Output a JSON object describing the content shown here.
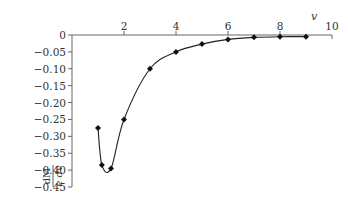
{
  "chart_data": {
    "type": "line",
    "title": "",
    "xlabel": "v",
    "ylabel": "dM / e dv",
    "ylabel_numerator": "dM",
    "ylabel_denominator": "e dv",
    "xlim": [
      0,
      10
    ],
    "ylim": [
      -0.45,
      0
    ],
    "x_ticks": [
      2,
      4,
      6,
      8,
      10
    ],
    "y_ticks": [
      0,
      -0.05,
      -0.1,
      -0.15,
      -0.2,
      -0.25,
      -0.3,
      -0.35,
      -0.4,
      -0.45
    ],
    "x_tick_labels": [
      "2",
      "4",
      "6",
      "8",
      "10"
    ],
    "y_tick_labels": [
      "0",
      "−0.05",
      "−0.10",
      "−0.15",
      "−0.20",
      "−0.25",
      "−0.30",
      "−0.35",
      "−0.40",
      "−0.45"
    ],
    "x_axis_position": "top",
    "grid": false,
    "legend": null,
    "series": [
      {
        "name": "dM/edv",
        "marker": "diamond",
        "color": "#111111",
        "x": [
          1.0,
          1.15,
          1.5,
          2.0,
          3.0,
          4.0,
          5.0,
          6.0,
          7.0,
          8.0,
          9.0
        ],
        "values": [
          -0.275,
          -0.385,
          -0.395,
          -0.25,
          -0.1,
          -0.05,
          -0.027,
          -0.013,
          -0.007,
          -0.005,
          -0.005
        ]
      }
    ]
  }
}
